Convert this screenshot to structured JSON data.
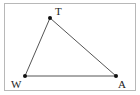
{
  "diagram": {
    "type": "triangle",
    "vertices": [
      {
        "label": "T",
        "x": 50,
        "y": 18,
        "label_x": 55,
        "label_y": 15
      },
      {
        "label": "W",
        "x": 25,
        "y": 76,
        "label_x": 11,
        "label_y": 88
      },
      {
        "label": "A",
        "x": 116,
        "y": 76,
        "label_x": 118,
        "label_y": 88
      }
    ],
    "edges": [
      [
        "T",
        "W"
      ],
      [
        "W",
        "A"
      ],
      [
        "A",
        "T"
      ]
    ],
    "colors": {
      "stroke": "#555555",
      "point": "#111111",
      "border": "#b8b8b8"
    }
  }
}
